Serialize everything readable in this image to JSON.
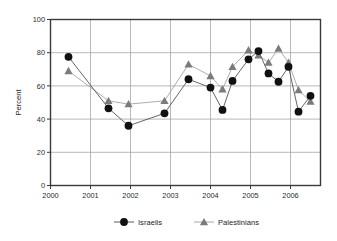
{
  "chart_data": {
    "type": "line",
    "title": "",
    "xlabel": "",
    "ylabel": "Percent",
    "ylim": [
      0,
      100
    ],
    "yticks": [
      0,
      20,
      40,
      60,
      80,
      100
    ],
    "xlim": [
      2000,
      2006.75
    ],
    "xticks": [
      2000,
      2001,
      2002,
      2003,
      2004,
      2005,
      2006
    ],
    "xtick_labels": [
      "2000",
      "2001",
      "2002",
      "2003",
      "2004",
      "2005",
      "2006"
    ],
    "ytick_labels": [
      "0",
      "20",
      "40",
      "60",
      "80",
      "100"
    ],
    "grid": true,
    "legend_position": "bottom",
    "series": [
      {
        "name": "Israelis",
        "marker": "circle",
        "color": "#111111",
        "x": [
          2000.45,
          2001.45,
          2001.95,
          2002.85,
          2003.45,
          2004.0,
          2004.3,
          2004.55,
          2004.95,
          2005.2,
          2005.45,
          2005.7,
          2005.95,
          2006.2,
          2006.5
        ],
        "values": [
          77.5,
          46.5,
          36.0,
          43.5,
          64.0,
          59.0,
          45.5,
          63.0,
          76.0,
          81.0,
          67.5,
          62.5,
          71.5,
          44.5,
          54.0
        ]
      },
      {
        "name": "Palestinians",
        "marker": "triangle",
        "color": "#7b7b7b",
        "x": [
          2000.45,
          2001.45,
          2001.95,
          2002.85,
          2003.45,
          2004.0,
          2004.3,
          2004.55,
          2004.95,
          2005.2,
          2005.45,
          2005.7,
          2005.95,
          2006.2,
          2006.5
        ],
        "values": [
          69.0,
          51.0,
          49.0,
          51.0,
          73.0,
          66.0,
          58.0,
          71.5,
          81.5,
          78.5,
          74.0,
          82.5,
          74.0,
          57.5,
          50.5
        ]
      }
    ]
  },
  "legend": {
    "items": [
      {
        "label": "Israelis",
        "marker": "circle-marker",
        "color": "#111111"
      },
      {
        "label": "Palestinians",
        "marker": "triangle-marker",
        "color": "#7b7b7b"
      }
    ]
  },
  "axes": {
    "y_title": "Percent"
  }
}
